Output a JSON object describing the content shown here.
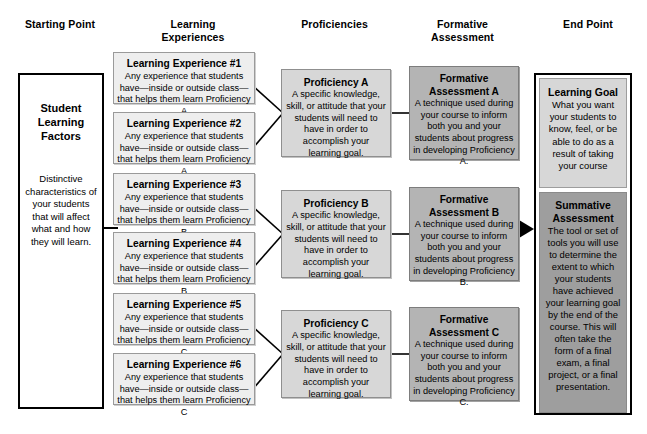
{
  "headers": [
    {
      "label": "Starting Point"
    },
    {
      "label": "Learning\nExperiences",
      "line1": "Learning",
      "line2": "Experiences"
    },
    {
      "label": "Proficiencies"
    },
    {
      "label": "Formative\nAssessment",
      "line1": "Formative",
      "line2": "Assessment"
    },
    {
      "label": "End Point"
    }
  ],
  "header_text": {
    "starting_point": "Starting Point",
    "learning_experiences_l1": "Learning",
    "learning_experiences_l2": "Experiences",
    "proficiencies": "Proficiencies",
    "formative_assessment_l1": "Formative",
    "formative_assessment_l2": "Assessment",
    "end_point": "End Point"
  },
  "starting_point": {
    "title_l1": "Student",
    "title_l2": "Learning",
    "title_l3": "Factors",
    "description": "Distinctive characteristics of your students that will affect what and how they will learn."
  },
  "learning_experiences": [
    {
      "title": "Learning Experience #1",
      "description": "Any experience that students have—inside or outside class—that helps them learn Proficiency A"
    },
    {
      "title": "Learning Experience #2",
      "description": "Any experience that students have—inside or outside class—that helps them learn Proficiency A"
    },
    {
      "title": "Learning Experience #3",
      "description": "Any experience that students have—inside or outside class—that helps them learn Proficiency B"
    },
    {
      "title": "Learning Experience #4",
      "description": "Any experience that students have—inside or outside class—that helps them learn Proficiency B"
    },
    {
      "title": "Learning Experience #5",
      "description": "Any experience that students have—inside or outside class—that helps them learn Proficiency C"
    },
    {
      "title": "Learning Experience #6",
      "description": "Any experience that students have—inside or outside class—that helps them learn Proficiency C"
    }
  ],
  "proficiencies": [
    {
      "title": "Proficiency A",
      "description": "A specific knowledge, skill, or attitude that your students will need to have in order to accomplish your learning goal."
    },
    {
      "title": "Proficiency B",
      "description": "A specific knowledge, skill, or attitude that your students will need to have in order to accomplish your learning goal."
    },
    {
      "title": "Proficiency C",
      "description": "A specific knowledge, skill, or attitude that your students will need to have in order to accomplish your learning goal."
    }
  ],
  "formative_assessments": [
    {
      "title_l1": "Formative",
      "title_l2": "Assessment A",
      "description": "A technique used during your course to inform both you and your students about progress in developing Proficiency A."
    },
    {
      "title_l1": "Formative",
      "title_l2": "Assessment B",
      "description": "A technique used during your course to inform both you and your students about progress in developing Proficiency B."
    },
    {
      "title_l1": "Formative",
      "title_l2": "Assessment C",
      "description": "A technique used during your course to inform both you and your students about progress in developing Proficiency C."
    }
  ],
  "end_point": {
    "learning_goal": {
      "title": "Learning Goal",
      "description": "What you want your students to know, feel, or be able to do as a result of taking your course"
    },
    "summative_assessment": {
      "title_l1": "Summative",
      "title_l2": "Assessment",
      "description": "The tool or set of tools you will use to determine the extent to which your students have achieved your learning goal by the end of the course. This will often take the form of a final exam, a final project, or a final presentation."
    }
  },
  "colors": {
    "learning_experience_fill": "#eeeeee",
    "proficiency_fill": "#d7d7d7",
    "formative_fill": "#b4b4b4",
    "summative_fill": "#9e9e9e",
    "outline": "#000000"
  }
}
